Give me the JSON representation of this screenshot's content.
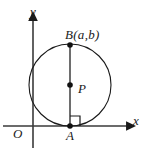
{
  "figure": {
    "type": "geometry-diagram",
    "background_color": "#ffffff",
    "stroke_color": "#1a1a1a",
    "axes": {
      "x_axis_label": "x",
      "y_axis_label": "y",
      "origin_label": "O",
      "x_axis_y": 126,
      "y_axis_x": 33,
      "x_axis_start": 3,
      "x_axis_end": 130,
      "y_axis_top": 17,
      "y_axis_bottom": 148
    },
    "circle": {
      "center_x": 70,
      "center_y": 89,
      "radius_x": 41,
      "radius_y": 42
    },
    "points": [
      {
        "name": "B",
        "label": "B(a,b)",
        "x": 70,
        "y": 47,
        "dot": true
      },
      {
        "name": "P",
        "label": "P",
        "x": 70,
        "y": 89,
        "dot": true
      },
      {
        "name": "A",
        "label": "A",
        "x": 70,
        "y": 126,
        "dot": true
      }
    ],
    "segments": [
      {
        "name": "BA",
        "from": "B",
        "to": "A"
      }
    ],
    "right_angle_marker": {
      "at_point": "A",
      "size": 10,
      "orientation": "upper-right"
    }
  }
}
